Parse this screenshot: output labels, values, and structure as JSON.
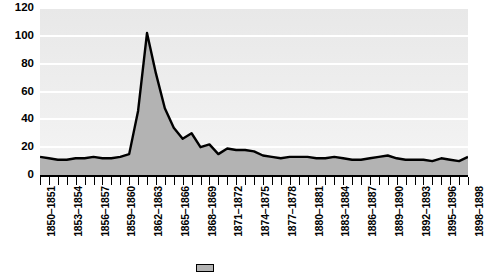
{
  "chart_data": {
    "type": "area",
    "title": "",
    "xlabel": "",
    "ylabel": "",
    "ylim": [
      0,
      120
    ],
    "ytick_values": [
      0,
      20,
      40,
      60,
      80,
      100,
      120
    ],
    "ytick_labels": [
      "0",
      "20",
      "40",
      "60",
      "80",
      "100",
      "120"
    ],
    "grid": true,
    "grid_orientation": "horizontal",
    "legend_position": "bottom",
    "legend_entries": [
      "series-1"
    ],
    "fill_color": "#b3b3b3",
    "line_color": "#000000",
    "plot_background": "#eeeeee",
    "gridline_color": "#ffffff",
    "x_tick_count": 49,
    "x_label_interval": 3,
    "categories": [
      "1850-1851",
      "1851-1852",
      "1852-1853",
      "1853-1854",
      "1854-1855",
      "1855-1856",
      "1856-1857",
      "1857-1858",
      "1858-1859",
      "1859-1860",
      "1860-1861",
      "1861-1862",
      "1862-1863",
      "1863-1864",
      "1864-1865",
      "1865-1866",
      "1866-1867",
      "1867-1868",
      "1868-1869",
      "1869-1870",
      "1870-1871",
      "1871-1872",
      "1872-1873",
      "1873-1874",
      "1874-1875",
      "1875-1876",
      "1876-1877",
      "1877-1878",
      "1878-1879",
      "1879-1880",
      "1880-1881",
      "1881-1882",
      "1882-1883",
      "1883-1884",
      "1884-1885",
      "1885-1886",
      "1886-1887",
      "1887-1888",
      "1888-1889",
      "1889-1890",
      "1890-1891",
      "1891-1892",
      "1892-1893",
      "1893-1894",
      "1894-1895",
      "1895-1896",
      "1896-1897",
      "1897-1898",
      "1898-1898"
    ],
    "visible_x_labels": [
      "1850–1851",
      "1853–1854",
      "1856–1857",
      "1859–1860",
      "1862–1863",
      "1865–1866",
      "1868–1869",
      "1871–1872",
      "1874–1875",
      "1877–1878",
      "1880–1881",
      "1883–1884",
      "1886–1887",
      "1889–1890",
      "1892–1893",
      "1895–1896",
      "1898–1898"
    ],
    "values": [
      13,
      12,
      11,
      11,
      12,
      12,
      13,
      12,
      12,
      13,
      15,
      46,
      102,
      73,
      48,
      34,
      26,
      30,
      20,
      22,
      15,
      19,
      18,
      18,
      17,
      14,
      13,
      12,
      13,
      13,
      13,
      12,
      12,
      13,
      12,
      11,
      11,
      12,
      13,
      14,
      12,
      11,
      11,
      11,
      10,
      12,
      11,
      10,
      13
    ]
  }
}
